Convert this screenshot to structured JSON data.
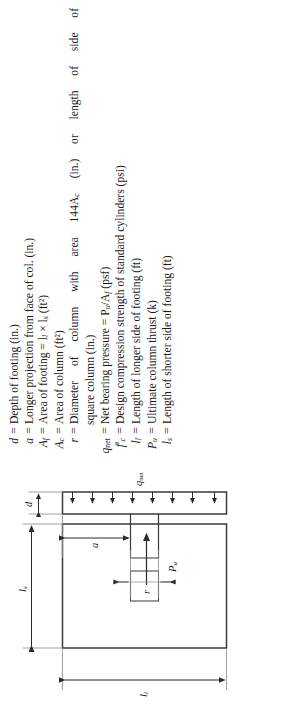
{
  "page": {
    "orientation": "rotated-90-ccw",
    "background": "#ffffff",
    "ink": "#1a1a1a"
  },
  "notation": {
    "equals": "=",
    "entries": [
      {
        "symbol": "d",
        "sub": "",
        "prime": false,
        "desc": "Depth of footing (in.)"
      },
      {
        "symbol": "a",
        "sub": "",
        "prime": false,
        "desc": "Longer projection from face of col. (in.)"
      },
      {
        "symbol": "A",
        "sub": "f",
        "prime": false,
        "desc": "Area of footing = l",
        "desc2": " × l",
        "desc3": " (ft²)"
      },
      {
        "symbol": "A",
        "sub": "c",
        "prime": false,
        "desc": "Area of column (ft²)"
      },
      {
        "symbol": "r",
        "sub": "",
        "prime": false,
        "desc": "Diameter of column with area 144A",
        "desc2": " (in.) or length of side of",
        "cont": "square column (in.)"
      },
      {
        "symbol": "q",
        "sub": "net",
        "prime": false,
        "desc": "Net bearing pressure = P",
        "desc2": "/A",
        "desc3": " (psf)"
      },
      {
        "symbol": "f",
        "sub": "c",
        "prime": true,
        "desc": "Design compression strength of standard cylinders (psi)"
      },
      {
        "symbol": "l",
        "sub": "l",
        "prime": false,
        "desc": "Length of longer side of footing (ft)"
      },
      {
        "symbol": "P",
        "sub": "u",
        "prime": false,
        "desc": "Ultimate column thrust (k)"
      },
      {
        "symbol": "l",
        "sub": "s",
        "prime": false,
        "desc": "Length of shorter side of footing (ft)"
      }
    ],
    "line_texts": [
      "d = Depth of footing (in.)",
      "a = Longer projection from face of col. (in.)",
      "A_f = Area of footing = l_l × l_s (ft²)",
      "A_c = Area of column (ft²)",
      "r = Diameter of column with area 144A_c (in.) or length of side of square column (in.)",
      "q_net = Net bearing pressure = P_u/A_f (psf)",
      "f'_c = Design compression strength of standard cylinders (psi)",
      "l_l = Length of longer side of footing (ft)",
      "P_u = Ultimate column thrust (k)",
      "l_s = Length of shorter side of footing (ft)"
    ]
  },
  "figure": {
    "plan_view": {
      "name": "plan-view-of-footing",
      "footing_outline": "rectangle",
      "column_outline": "small-square-centered",
      "dim_long_side": "l",
      "dim_long_side_sub": "l",
      "dim_short_side": "l",
      "dim_short_side_sub": "s"
    },
    "elevation_view": {
      "name": "elevation-section-of-footing",
      "dim_projection": "a",
      "dim_column_width": "r",
      "dim_depth": "d",
      "load_label": "P",
      "load_label_sub": "u",
      "pressure_label": "q",
      "pressure_label_sub": "net",
      "pressure_arrow_count": 8
    }
  }
}
